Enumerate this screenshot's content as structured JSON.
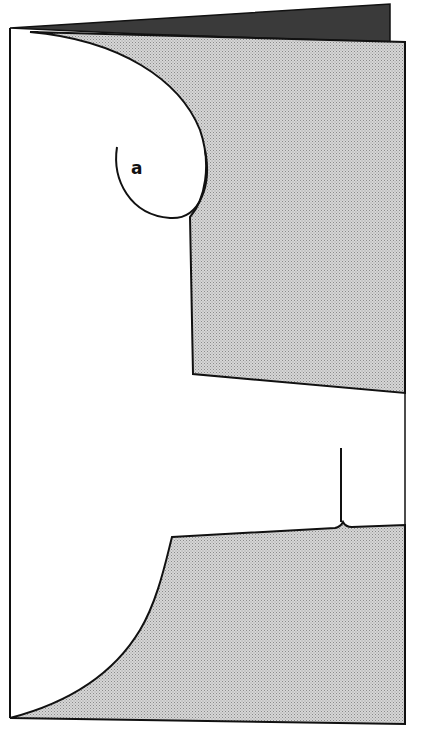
{
  "figure": {
    "type": "folded card with cut-out silhouette",
    "labels": [
      {
        "id": "a",
        "text": "a"
      }
    ],
    "colors": {
      "line": "#111111",
      "shaded_panel": "#c8c8c8",
      "top_edge": "#3a3a3a",
      "paper": "#ffffff"
    }
  }
}
